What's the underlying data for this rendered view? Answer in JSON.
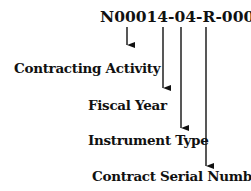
{
  "diagram": {
    "code": "N00014-04-R-0003",
    "labels": [
      {
        "text": "Contracting Activity"
      },
      {
        "text": "Fiscal Year"
      },
      {
        "text": "Instrument Type"
      },
      {
        "text": "Contract Serial Number"
      }
    ]
  }
}
